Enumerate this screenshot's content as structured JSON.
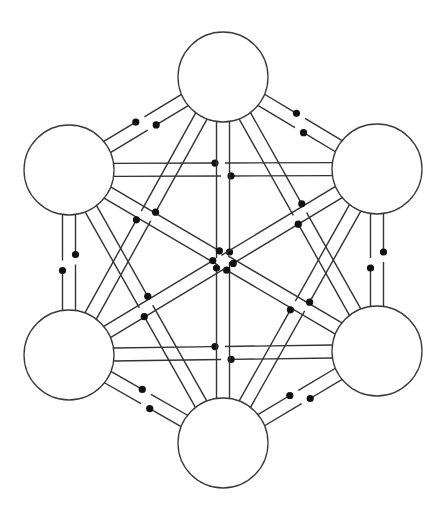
{
  "diagram": {
    "type": "complete-graph-switch-network",
    "background": "#ffffff",
    "stroke_color": "#333333",
    "dot_color": "#111111",
    "line_spacing": 13,
    "node_radius": 45,
    "nodes": [
      {
        "id": "top",
        "x": 223,
        "y": 77
      },
      {
        "id": "upper-left",
        "x": 69,
        "y": 170
      },
      {
        "id": "upper-right",
        "x": 377,
        "y": 169
      },
      {
        "id": "lower-left",
        "x": 69,
        "y": 355
      },
      {
        "id": "lower-right",
        "x": 377,
        "y": 351
      },
      {
        "id": "bottom",
        "x": 223,
        "y": 443
      }
    ],
    "edges": [
      {
        "from": "upper-left",
        "to": "top"
      },
      {
        "from": "top",
        "to": "upper-right"
      },
      {
        "from": "upper-right",
        "to": "lower-right"
      },
      {
        "from": "lower-right",
        "to": "bottom"
      },
      {
        "from": "bottom",
        "to": "lower-left"
      },
      {
        "from": "lower-left",
        "to": "upper-left"
      },
      {
        "from": "upper-left",
        "to": "upper-right"
      },
      {
        "from": "lower-left",
        "to": "lower-right"
      },
      {
        "from": "top",
        "to": "bottom"
      },
      {
        "from": "upper-left",
        "to": "lower-right"
      },
      {
        "from": "upper-right",
        "to": "lower-left"
      },
      {
        "from": "top",
        "to": "lower-left"
      },
      {
        "from": "top",
        "to": "lower-right"
      },
      {
        "from": "upper-left",
        "to": "bottom"
      },
      {
        "from": "upper-right",
        "to": "bottom"
      }
    ]
  }
}
